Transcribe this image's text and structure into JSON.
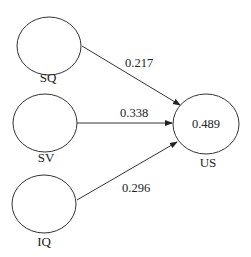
{
  "diagram": {
    "type": "path-model",
    "nodes": [
      {
        "id": "SQ",
        "label": "SQ",
        "value": ""
      },
      {
        "id": "SV",
        "label": "SV",
        "value": ""
      },
      {
        "id": "IQ",
        "label": "IQ",
        "value": ""
      },
      {
        "id": "US",
        "label": "US",
        "value": "0.489"
      }
    ],
    "edges": [
      {
        "from": "SQ",
        "to": "US",
        "coefficient": "0.217"
      },
      {
        "from": "SV",
        "to": "US",
        "coefficient": "0.338"
      },
      {
        "from": "IQ",
        "to": "US",
        "coefficient": "0.296"
      }
    ]
  }
}
